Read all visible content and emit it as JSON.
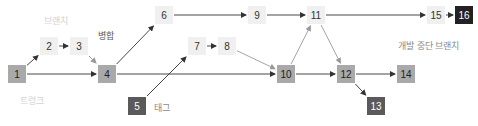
{
  "diagram": {
    "type": "version-control-branch-graph",
    "labels": {
      "branch": "브랜치",
      "merge": "병합",
      "trunk": "트렁크",
      "tag": "태그",
      "dead_branch": "개발 중단 브랜치"
    },
    "colors": {
      "light": "#f0f0f0",
      "gray": "#a9a9a9",
      "dark": "#5a5a5a",
      "black": "#222222",
      "edge_dark": "#333333",
      "edge_light": "#999999"
    },
    "nodes": [
      {
        "id": "1",
        "label": "1",
        "x": 8,
        "y": 65,
        "style": "gray"
      },
      {
        "id": "2",
        "label": "2",
        "x": 40,
        "y": 37,
        "style": "light"
      },
      {
        "id": "3",
        "label": "3",
        "x": 70,
        "y": 37,
        "style": "light"
      },
      {
        "id": "4",
        "label": "4",
        "x": 98,
        "y": 65,
        "style": "gray"
      },
      {
        "id": "5",
        "label": "5",
        "x": 128,
        "y": 97,
        "style": "dark"
      },
      {
        "id": "6",
        "label": "6",
        "x": 155,
        "y": 6,
        "style": "light"
      },
      {
        "id": "7",
        "label": "7",
        "x": 188,
        "y": 37,
        "style": "light"
      },
      {
        "id": "8",
        "label": "8",
        "x": 218,
        "y": 37,
        "style": "light"
      },
      {
        "id": "9",
        "label": "9",
        "x": 248,
        "y": 6,
        "style": "light"
      },
      {
        "id": "10",
        "label": "10",
        "x": 277,
        "y": 65,
        "style": "gray"
      },
      {
        "id": "11",
        "label": "11",
        "x": 307,
        "y": 6,
        "style": "light"
      },
      {
        "id": "12",
        "label": "12",
        "x": 337,
        "y": 65,
        "style": "gray"
      },
      {
        "id": "13",
        "label": "13",
        "x": 367,
        "y": 97,
        "style": "dark"
      },
      {
        "id": "14",
        "label": "14",
        "x": 397,
        "y": 65,
        "style": "gray"
      },
      {
        "id": "15",
        "label": "15",
        "x": 427,
        "y": 6,
        "style": "light"
      },
      {
        "id": "16",
        "label": "16",
        "x": 455,
        "y": 6,
        "style": "black"
      }
    ],
    "edges": [
      {
        "from": "1",
        "to": "2",
        "tone": "dark"
      },
      {
        "from": "2",
        "to": "3",
        "tone": "dark"
      },
      {
        "from": "3",
        "to": "4",
        "tone": "light"
      },
      {
        "from": "1",
        "to": "4",
        "tone": "dark"
      },
      {
        "from": "4",
        "to": "6",
        "tone": "dark"
      },
      {
        "from": "4",
        "to": "10",
        "tone": "dark"
      },
      {
        "from": "5",
        "to": "7",
        "tone": "dark"
      },
      {
        "from": "7",
        "to": "8",
        "tone": "dark"
      },
      {
        "from": "8",
        "to": "10",
        "tone": "light"
      },
      {
        "from": "6",
        "to": "9",
        "tone": "dark"
      },
      {
        "from": "9",
        "to": "11",
        "tone": "dark"
      },
      {
        "from": "10",
        "to": "11",
        "tone": "light"
      },
      {
        "from": "10",
        "to": "12",
        "tone": "dark"
      },
      {
        "from": "11",
        "to": "12",
        "tone": "light"
      },
      {
        "from": "11",
        "to": "15",
        "tone": "dark"
      },
      {
        "from": "15",
        "to": "16",
        "tone": "dark"
      },
      {
        "from": "12",
        "to": "14",
        "tone": "dark"
      },
      {
        "from": "12",
        "to": "13",
        "tone": "dark"
      }
    ]
  }
}
